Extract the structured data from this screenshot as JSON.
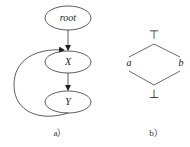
{
  "figure_a": {
    "caption": "a）",
    "nodes": [
      {
        "id": "root",
        "label": "root"
      },
      {
        "id": "X",
        "label": "X"
      },
      {
        "id": "Y",
        "label": "Y"
      }
    ],
    "edges": [
      {
        "from": "root",
        "to": "X"
      },
      {
        "from": "X",
        "to": "Y"
      },
      {
        "from": "Y",
        "to": "X",
        "style": "curved-back-edge"
      }
    ]
  },
  "figure_b": {
    "caption": "b）",
    "top_symbol": "⊤",
    "bottom_symbol": "⊥",
    "left_label": "a",
    "right_label": "b"
  }
}
